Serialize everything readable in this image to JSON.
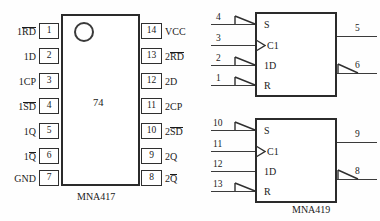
{
  "figure": {
    "background": "#fefefe",
    "line_color": "#2b2b2b"
  },
  "dip_package": {
    "caption": "MNA417",
    "body_marking": "74",
    "notch_icon": "circle-notch-icon",
    "left_pins": [
      {
        "number": "1",
        "label_prefix": "1",
        "label_over": "RD",
        "label_suffix": ""
      },
      {
        "number": "2",
        "label_prefix": "1D",
        "label_over": "",
        "label_suffix": ""
      },
      {
        "number": "3",
        "label_prefix": "1CP",
        "label_over": "",
        "label_suffix": ""
      },
      {
        "number": "4",
        "label_prefix": "1",
        "label_over": "SD",
        "label_suffix": ""
      },
      {
        "number": "5",
        "label_prefix": "1Q",
        "label_over": "",
        "label_suffix": ""
      },
      {
        "number": "6",
        "label_prefix": "1",
        "label_over": "Q",
        "label_suffix": ""
      },
      {
        "number": "7",
        "label_prefix": "GND",
        "label_over": "",
        "label_suffix": ""
      }
    ],
    "right_pins": [
      {
        "number": "14",
        "label_prefix": "VCC",
        "label_over": "",
        "label_suffix": ""
      },
      {
        "number": "13",
        "label_prefix": "2",
        "label_over": "RD",
        "label_suffix": ""
      },
      {
        "number": "12",
        "label_prefix": "2D",
        "label_over": "",
        "label_suffix": ""
      },
      {
        "number": "11",
        "label_prefix": "2CP",
        "label_over": "",
        "label_suffix": ""
      },
      {
        "number": "10",
        "label_prefix": "2",
        "label_over": "SD",
        "label_suffix": ""
      },
      {
        "number": "9",
        "label_prefix": "2Q",
        "label_over": "",
        "label_suffix": ""
      },
      {
        "number": "8",
        "label_prefix": "2",
        "label_over": "Q",
        "label_suffix": ""
      }
    ]
  },
  "logic_symbols": {
    "caption": "MNA419",
    "blocks": [
      {
        "name": "flip-flop-1",
        "inputs": [
          {
            "number": "4",
            "port": "S",
            "marker": "polarity-triangle-icon"
          },
          {
            "number": "3",
            "port": "C1",
            "marker": "dynamic-input-wedge-icon"
          },
          {
            "number": "2",
            "port": "1D",
            "marker": "polarity-triangle-icon"
          },
          {
            "number": "1",
            "port": "R",
            "marker": "polarity-triangle-icon"
          }
        ],
        "outputs": [
          {
            "number": "5",
            "marker": "none"
          },
          {
            "number": "6",
            "marker": "inverting-triangle-icon"
          }
        ]
      },
      {
        "name": "flip-flop-2",
        "inputs": [
          {
            "number": "10",
            "port": "S",
            "marker": "polarity-triangle-icon"
          },
          {
            "number": "11",
            "port": "C1",
            "marker": "dynamic-input-wedge-icon"
          },
          {
            "number": "12",
            "port": "1D",
            "marker": "none"
          },
          {
            "number": "13",
            "port": "R",
            "marker": "polarity-triangle-icon"
          }
        ],
        "outputs": [
          {
            "number": "9",
            "marker": "none"
          },
          {
            "number": "8",
            "marker": "inverting-triangle-icon"
          }
        ]
      }
    ]
  }
}
